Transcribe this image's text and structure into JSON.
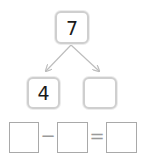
{
  "number_bond": {
    "whole": "7",
    "parts": [
      "4",
      ""
    ]
  },
  "equation": {
    "boxes": [
      "",
      "",
      ""
    ],
    "operator": "−",
    "equals": "="
  },
  "colors": {
    "box_border": "#cfcfcf",
    "arrow": "#bdbdbd",
    "equation_border": "#a9a9a9"
  }
}
